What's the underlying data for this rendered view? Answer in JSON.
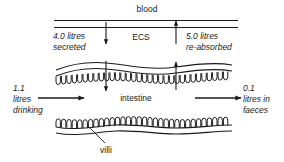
{
  "diagram": {
    "type": "biological-flow-diagram",
    "stroke_color": "#1a1a1a",
    "background_color": "#ffffff"
  },
  "labels": {
    "blood": "blood",
    "ecs": "ECS",
    "intestine": "intestine",
    "villi": "villi",
    "secreted_line1": "4.0 litres",
    "secreted_line2": "secreted",
    "reabsorbed_line1": "5.0 litres",
    "reabsorbed_line2": "re-absorbed",
    "drinking_line1": "1.1",
    "drinking_line2": "litres",
    "drinking_line3": "drinking",
    "faeces_line1": "0.1",
    "faeces_line2": "litres in",
    "faeces_line3": "faeces"
  },
  "flows": [
    {
      "name": "drinking",
      "value": 1.1,
      "unit": "litres",
      "direction": "in",
      "label": "1.1 litres drinking"
    },
    {
      "name": "secreted",
      "value": 4.0,
      "unit": "litres",
      "direction": "blood-to-intestine",
      "label": "4.0 litres secreted"
    },
    {
      "name": "re-absorbed",
      "value": 5.0,
      "unit": "litres",
      "direction": "intestine-to-blood",
      "label": "5.0 litres re-absorbed"
    },
    {
      "name": "faeces",
      "value": 0.1,
      "unit": "litres",
      "direction": "out",
      "label": "0.1 litres in faeces"
    }
  ],
  "compartments": [
    {
      "name": "blood",
      "label": "blood"
    },
    {
      "name": "ecs",
      "label": "ECS"
    },
    {
      "name": "intestine",
      "label": "intestine"
    }
  ],
  "structures": [
    {
      "name": "villi",
      "label": "villi"
    }
  ]
}
